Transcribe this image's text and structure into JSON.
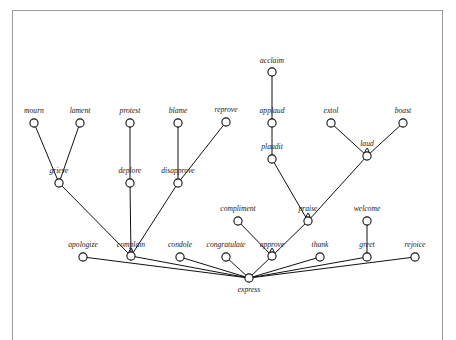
{
  "figure": {
    "kind": "lexical-hierarchy-graph",
    "root_label": "express",
    "border_color": "#9a9a9a",
    "line_color": "#111111",
    "node_fill": "#ffffff",
    "background": "#ffffff"
  },
  "nodes": [
    {
      "id": "acclaim",
      "label": "acclaim",
      "x": 272,
      "y": 72,
      "label_x": 272,
      "label_y": 63,
      "tick": false
    },
    {
      "id": "mourn",
      "label": "mourn",
      "x": 34,
      "y": 123,
      "label_x": 34,
      "label_y": 113,
      "tick": false
    },
    {
      "id": "lament",
      "label": "lament",
      "x": 80,
      "y": 123,
      "label_x": 80,
      "label_y": 113,
      "tick": false
    },
    {
      "id": "protest",
      "label": "protest",
      "x": 130,
      "y": 123,
      "label_x": 130,
      "label_y": 113,
      "tick": false
    },
    {
      "id": "blame",
      "label": "blame",
      "x": 178,
      "y": 123,
      "label_x": 178,
      "label_y": 113,
      "tick": false
    },
    {
      "id": "reprove",
      "label": "reprove",
      "x": 226,
      "y": 122,
      "label_x": 226,
      "label_y": 112,
      "tick": false
    },
    {
      "id": "applaud",
      "label": "applaud",
      "x": 272,
      "y": 123,
      "label_x": 272,
      "label_y": 113,
      "tick": false
    },
    {
      "id": "extol",
      "label": "extol",
      "x": 331,
      "y": 123,
      "label_x": 331,
      "label_y": 113,
      "tick": false
    },
    {
      "id": "boast",
      "label": "boast",
      "x": 403,
      "y": 123,
      "label_x": 403,
      "label_y": 113,
      "tick": false
    },
    {
      "id": "plaudit",
      "label": "plaudit",
      "x": 272,
      "y": 159,
      "label_x": 272,
      "label_y": 149,
      "tick": false
    },
    {
      "id": "laud",
      "label": "laud",
      "x": 367,
      "y": 156,
      "label_x": 367,
      "label_y": 146,
      "tick": true
    },
    {
      "id": "grieve",
      "label": "grieve",
      "x": 59,
      "y": 183,
      "label_x": 59,
      "label_y": 173,
      "tick": false
    },
    {
      "id": "deplore",
      "label": "deplore",
      "x": 130,
      "y": 183,
      "label_x": 130,
      "label_y": 173,
      "tick": false
    },
    {
      "id": "disapprove",
      "label": "disapprove",
      "x": 178,
      "y": 183,
      "label_x": 178,
      "label_y": 173,
      "tick": false
    },
    {
      "id": "compliment",
      "label": "compliment",
      "x": 238,
      "y": 221,
      "label_x": 238,
      "label_y": 211,
      "tick": false
    },
    {
      "id": "praise",
      "label": "praise",
      "x": 308,
      "y": 221,
      "label_x": 308,
      "label_y": 211,
      "tick": true
    },
    {
      "id": "welcome",
      "label": "welcome",
      "x": 367,
      "y": 221,
      "label_x": 367,
      "label_y": 211,
      "tick": false
    },
    {
      "id": "apologize",
      "label": "apologize",
      "x": 83,
      "y": 257,
      "label_x": 83,
      "label_y": 247,
      "tick": false
    },
    {
      "id": "complain",
      "label": "complain",
      "x": 131,
      "y": 256,
      "label_x": 131,
      "label_y": 247,
      "tick": true
    },
    {
      "id": "condole",
      "label": "condole",
      "x": 180,
      "y": 257,
      "label_x": 180,
      "label_y": 247,
      "tick": false
    },
    {
      "id": "congratulate",
      "label": "congratulate",
      "x": 226,
      "y": 257,
      "label_x": 226,
      "label_y": 247,
      "tick": false
    },
    {
      "id": "approve",
      "label": "approve",
      "x": 272,
      "y": 256,
      "label_x": 272,
      "label_y": 247,
      "tick": true
    },
    {
      "id": "thank",
      "label": "thank",
      "x": 320,
      "y": 257,
      "label_x": 320,
      "label_y": 247,
      "tick": false
    },
    {
      "id": "greet",
      "label": "greet",
      "x": 367,
      "y": 257,
      "label_x": 367,
      "label_y": 247,
      "tick": false
    },
    {
      "id": "rejoice",
      "label": "rejoice",
      "x": 415,
      "y": 257,
      "label_x": 415,
      "label_y": 247,
      "tick": false
    },
    {
      "id": "express",
      "label": "express",
      "x": 249,
      "y": 278,
      "label_x": 249,
      "label_y": 292,
      "tick": false
    }
  ],
  "edges": [
    {
      "from": "mourn",
      "to": "grieve"
    },
    {
      "from": "lament",
      "to": "grieve"
    },
    {
      "from": "protest",
      "to": "deplore"
    },
    {
      "from": "blame",
      "to": "disapprove"
    },
    {
      "from": "reprove",
      "to": "disapprove"
    },
    {
      "from": "acclaim",
      "to": "applaud"
    },
    {
      "from": "applaud",
      "to": "plaudit"
    },
    {
      "from": "extol",
      "to": "laud"
    },
    {
      "from": "boast",
      "to": "laud"
    },
    {
      "from": "grieve",
      "to": "complain"
    },
    {
      "from": "deplore",
      "to": "complain"
    },
    {
      "from": "disapprove",
      "to": "complain"
    },
    {
      "from": "plaudit",
      "to": "praise"
    },
    {
      "from": "laud",
      "to": "praise"
    },
    {
      "from": "compliment",
      "to": "approve"
    },
    {
      "from": "praise",
      "to": "approve"
    },
    {
      "from": "welcome",
      "to": "greet"
    },
    {
      "from": "apologize",
      "to": "express"
    },
    {
      "from": "complain",
      "to": "express"
    },
    {
      "from": "condole",
      "to": "express"
    },
    {
      "from": "congratulate",
      "to": "express"
    },
    {
      "from": "approve",
      "to": "express"
    },
    {
      "from": "thank",
      "to": "express"
    },
    {
      "from": "greet",
      "to": "express"
    },
    {
      "from": "rejoice",
      "to": "express"
    }
  ]
}
